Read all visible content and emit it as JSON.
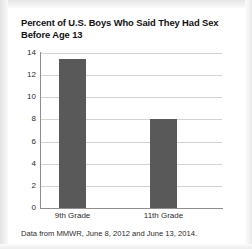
{
  "chart_data": {
    "type": "bar",
    "title": "Percent of U.S. Boys Who Said They Had Sex Before Age 13",
    "title_line1": "Percent of U.S. Boys Who Said They Had Sex",
    "title_line2": "Before Age 13",
    "categories": [
      "9th Grade",
      "11th Grade"
    ],
    "values": [
      13.5,
      8.0
    ],
    "xlabel": "",
    "ylabel": "",
    "ylim": [
      0,
      14
    ],
    "ytick_labels": [
      "14",
      "12",
      "10",
      "8",
      "6",
      "4",
      "2",
      "0"
    ],
    "ytick_values": [
      14,
      12,
      10,
      8,
      6,
      4,
      2,
      0
    ],
    "grid": true,
    "legend": "none",
    "bar_color": "#595959",
    "grid_color": "#d2d2d2",
    "axis_color": "#8e8e8e",
    "text_color": "#2b2b2b",
    "source_note": "Data from MMWR, June 8, 2012 and June 13, 2014."
  }
}
